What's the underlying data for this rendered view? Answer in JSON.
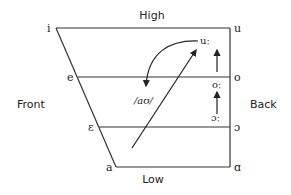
{
  "axis_labels": {
    "top": "High",
    "bottom": "Low",
    "left": "Front",
    "right": "Back"
  },
  "front_vowels": [
    "i",
    "e",
    "ɛ",
    "a"
  ],
  "back_vowels": [
    "u",
    "o",
    "ɔ",
    "ɑ"
  ],
  "inner_labels": {
    "uu_long": "uː",
    "oo_long": "oː",
    "open_o_long": "ɔː",
    "diphthong": "/aʊ/"
  },
  "arrows": [
    {
      "from": "ɔː",
      "to": "oː",
      "type": "straight"
    },
    {
      "from": "oː",
      "to": "uː",
      "type": "straight"
    },
    {
      "from": "a region",
      "to": "uː",
      "type": "straight-diagonal"
    },
    {
      "from": "uː",
      "to": "/aʊ/",
      "type": "curved"
    }
  ],
  "colors": {
    "line": "#333333",
    "text": "#222222",
    "background": "#ffffff"
  }
}
